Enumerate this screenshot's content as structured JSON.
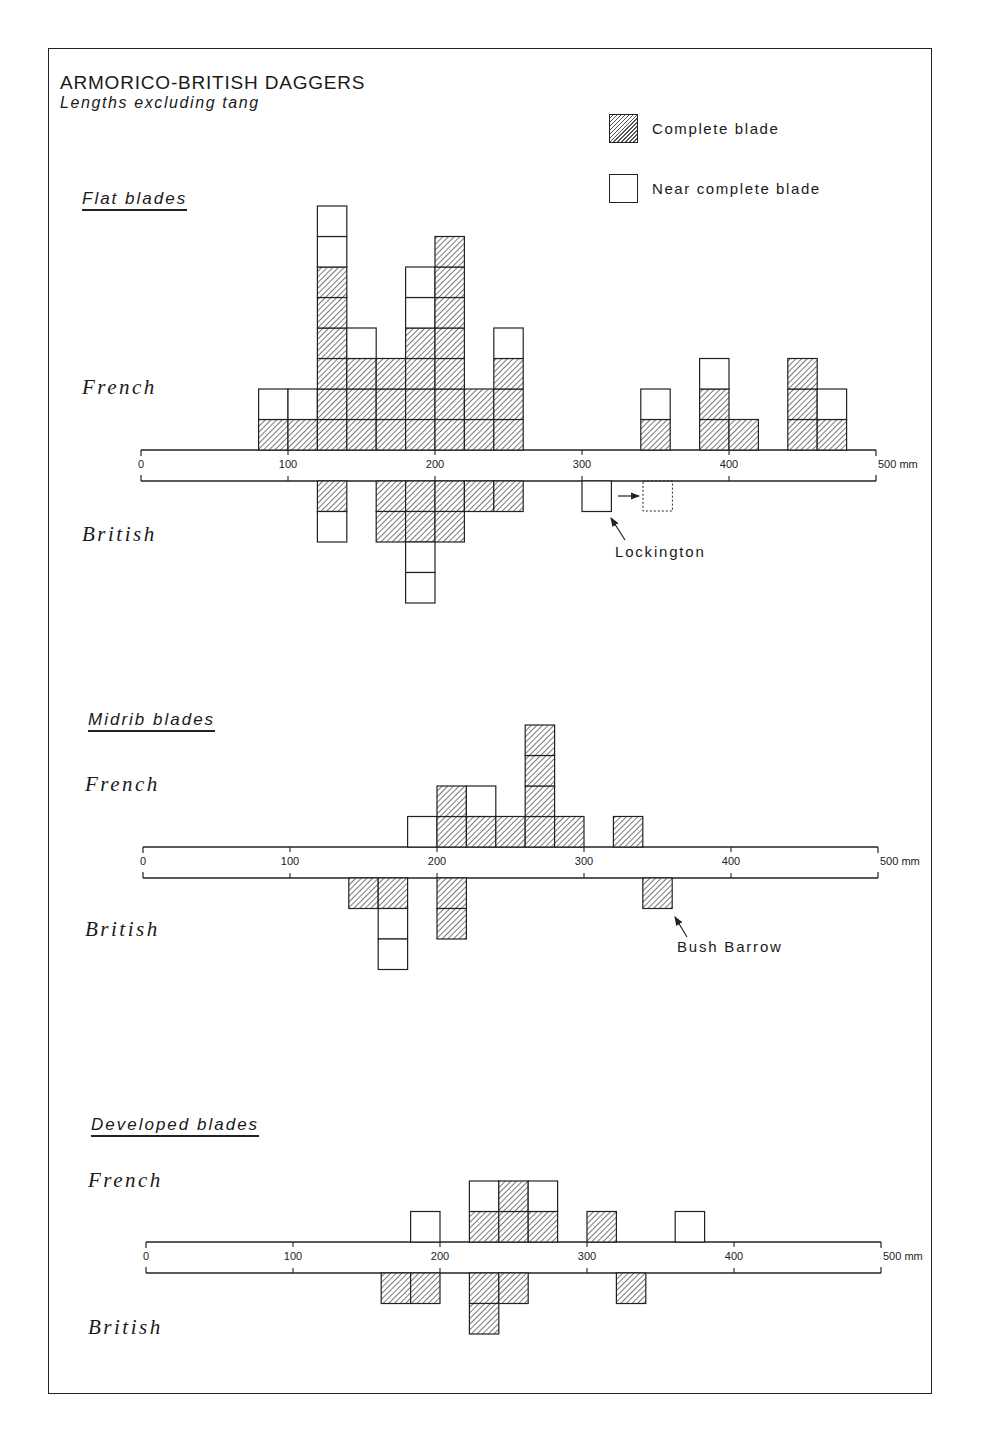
{
  "title": "ARMORICO-BRITISH DAGGERS",
  "subtitle": "Lengths excluding tang",
  "legend": {
    "complete": "Complete blade",
    "near_complete": "Near complete blade"
  },
  "sections": [
    {
      "title": "Flat blades",
      "french_label": "French",
      "british_label": "British"
    },
    {
      "title": "Midrib blades",
      "french_label": "French",
      "british_label": "British"
    },
    {
      "title": "Developed blades",
      "french_label": "French",
      "british_label": "British"
    }
  ],
  "axis": {
    "ticks": [
      "0",
      "100",
      "200",
      "300",
      "400",
      "500 mm"
    ]
  },
  "annotations": {
    "lockington": "Lockington",
    "bush_barrow": "Bush Barrow"
  },
  "colors": {
    "ink": "#222222",
    "hatch": "#555555",
    "paper": "#ffffff"
  },
  "chart_data": {
    "type": "bar",
    "title": "ARMORICO-BRITISH DAGGERS",
    "subtitle": "Lengths excluding tang",
    "xlabel": "Length (mm)",
    "ylabel": "Count (one square per dagger)",
    "xlim": [
      0,
      500
    ],
    "x_ticks": [
      0,
      100,
      200,
      300,
      400,
      500
    ],
    "bin_width_mm": 20,
    "legend": [
      "Complete blade (hatched)",
      "Near complete blade (open)"
    ],
    "legend_position": "top-right",
    "grid": false,
    "panels": [
      {
        "name": "Flat blades",
        "french": {
          "bins_start_mm": [
            80,
            100,
            120,
            140,
            160,
            180,
            200,
            220,
            240,
            340,
            380,
            400,
            440,
            460
          ],
          "complete": [
            1,
            1,
            6,
            3,
            3,
            4,
            7,
            2,
            3,
            1,
            2,
            1,
            3,
            1
          ],
          "near_complete": [
            1,
            1,
            2,
            1,
            0,
            2,
            0,
            0,
            1,
            1,
            1,
            0,
            0,
            1
          ]
        },
        "british": {
          "bins_start_mm": [
            120,
            160,
            180,
            200,
            220,
            240,
            300
          ],
          "complete": [
            1,
            2,
            2,
            2,
            1,
            1,
            0
          ],
          "near_complete": [
            1,
            0,
            2,
            0,
            0,
            0,
            1
          ]
        },
        "notes": [
          "Lockington: near complete blade at 300-320 mm, arrow to dotted reconstructed position at 340-360 mm"
        ]
      },
      {
        "name": "Midrib blades",
        "french": {
          "bins_start_mm": [
            180,
            200,
            220,
            240,
            260,
            280,
            320
          ],
          "complete": [
            0,
            2,
            1,
            1,
            4,
            1,
            1
          ],
          "near_complete": [
            1,
            0,
            1,
            0,
            0,
            0,
            0
          ]
        },
        "british": {
          "bins_start_mm": [
            140,
            160,
            200,
            340
          ],
          "complete": [
            1,
            1,
            2,
            1
          ],
          "near_complete": [
            0,
            2,
            0,
            0
          ]
        },
        "notes": [
          "Bush Barrow: complete blade at 340-360 mm (British)"
        ]
      },
      {
        "name": "Developed blades",
        "french": {
          "bins_start_mm": [
            180,
            220,
            240,
            260,
            300,
            360
          ],
          "complete": [
            0,
            1,
            2,
            1,
            1,
            0
          ],
          "near_complete": [
            1,
            1,
            0,
            1,
            0,
            1
          ]
        },
        "british": {
          "bins_start_mm": [
            160,
            180,
            220,
            240,
            320
          ],
          "complete": [
            1,
            1,
            2,
            1,
            1
          ],
          "near_complete": [
            0,
            0,
            0,
            0,
            0
          ]
        }
      }
    ]
  }
}
